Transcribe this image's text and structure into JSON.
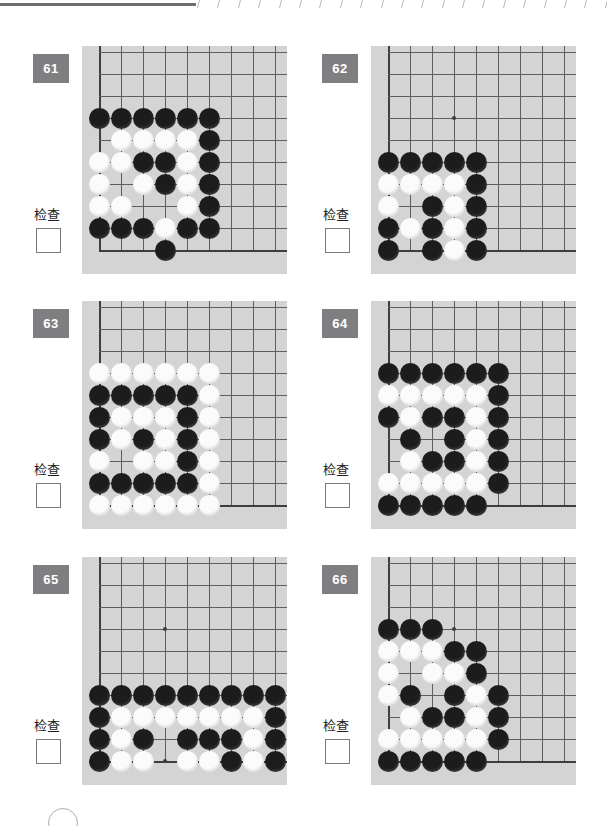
{
  "page": {
    "background_color": "#ffffff",
    "board_color": "#d4d4d4",
    "badge_color": "#7f7f82",
    "line_color": "#5d5d60",
    "black_stone_color": "#1c1c1c",
    "white_stone_color": "#fbfbfb"
  },
  "top_rule": {
    "tick_count": 21
  },
  "common": {
    "check_label": "检查",
    "checkbox_value": ""
  },
  "board_spec": {
    "cols": 9,
    "rows": 9,
    "spacing": 22,
    "origin_x": 17,
    "origin_y": 6,
    "star_points": [
      [
        3,
        3
      ],
      [
        3,
        9
      ]
    ]
  },
  "puzzles": [
    {
      "number": "61",
      "check_label": "检查",
      "black": [
        [
          0,
          3
        ],
        [
          1,
          3
        ],
        [
          2,
          3
        ],
        [
          3,
          3
        ],
        [
          4,
          3
        ],
        [
          5,
          3
        ],
        [
          5,
          4
        ],
        [
          2,
          5
        ],
        [
          3,
          5
        ],
        [
          5,
          5
        ],
        [
          3,
          6
        ],
        [
          5,
          6
        ],
        [
          5,
          7
        ],
        [
          0,
          8
        ],
        [
          1,
          8
        ],
        [
          2,
          8
        ],
        [
          4,
          8
        ],
        [
          5,
          8
        ],
        [
          3,
          9
        ]
      ],
      "white": [
        [
          1,
          4
        ],
        [
          2,
          4
        ],
        [
          3,
          4
        ],
        [
          4,
          4
        ],
        [
          0,
          5
        ],
        [
          1,
          5
        ],
        [
          4,
          5
        ],
        [
          0,
          6
        ],
        [
          2,
          6
        ],
        [
          4,
          6
        ],
        [
          0,
          7
        ],
        [
          1,
          7
        ],
        [
          4,
          7
        ],
        [
          3,
          8
        ]
      ]
    },
    {
      "number": "62",
      "check_label": "检查",
      "black": [
        [
          0,
          5
        ],
        [
          1,
          5
        ],
        [
          2,
          5
        ],
        [
          3,
          5
        ],
        [
          4,
          5
        ],
        [
          4,
          6
        ],
        [
          2,
          7
        ],
        [
          4,
          7
        ],
        [
          0,
          8
        ],
        [
          2,
          8
        ],
        [
          4,
          8
        ],
        [
          0,
          9
        ],
        [
          2,
          9
        ],
        [
          4,
          9
        ]
      ],
      "white": [
        [
          0,
          6
        ],
        [
          1,
          6
        ],
        [
          2,
          6
        ],
        [
          3,
          6
        ],
        [
          0,
          7
        ],
        [
          3,
          7
        ],
        [
          1,
          8
        ],
        [
          3,
          8
        ],
        [
          3,
          9
        ]
      ]
    },
    {
      "number": "63",
      "check_label": "检查",
      "black": [
        [
          0,
          4
        ],
        [
          1,
          4
        ],
        [
          2,
          4
        ],
        [
          3,
          4
        ],
        [
          4,
          4
        ],
        [
          0,
          5
        ],
        [
          4,
          5
        ],
        [
          0,
          6
        ],
        [
          2,
          6
        ],
        [
          4,
          6
        ],
        [
          4,
          7
        ],
        [
          0,
          8
        ],
        [
          1,
          8
        ],
        [
          2,
          8
        ],
        [
          3,
          8
        ],
        [
          4,
          8
        ]
      ],
      "white": [
        [
          0,
          3
        ],
        [
          1,
          3
        ],
        [
          2,
          3
        ],
        [
          3,
          3
        ],
        [
          4,
          3
        ],
        [
          5,
          3
        ],
        [
          5,
          4
        ],
        [
          1,
          5
        ],
        [
          2,
          5
        ],
        [
          3,
          5
        ],
        [
          5,
          5
        ],
        [
          1,
          6
        ],
        [
          3,
          6
        ],
        [
          5,
          6
        ],
        [
          0,
          7
        ],
        [
          2,
          7
        ],
        [
          3,
          7
        ],
        [
          5,
          7
        ],
        [
          5,
          8
        ],
        [
          0,
          9
        ],
        [
          1,
          9
        ],
        [
          2,
          9
        ],
        [
          3,
          9
        ],
        [
          4,
          9
        ],
        [
          5,
          9
        ]
      ]
    },
    {
      "number": "64",
      "check_label": "检查",
      "black": [
        [
          0,
          3
        ],
        [
          1,
          3
        ],
        [
          2,
          3
        ],
        [
          3,
          3
        ],
        [
          4,
          3
        ],
        [
          5,
          3
        ],
        [
          5,
          4
        ],
        [
          0,
          5
        ],
        [
          2,
          5
        ],
        [
          3,
          5
        ],
        [
          5,
          5
        ],
        [
          1,
          6
        ],
        [
          3,
          6
        ],
        [
          5,
          6
        ],
        [
          2,
          7
        ],
        [
          3,
          7
        ],
        [
          5,
          7
        ],
        [
          5,
          8
        ],
        [
          0,
          9
        ],
        [
          1,
          9
        ],
        [
          2,
          9
        ],
        [
          3,
          9
        ],
        [
          4,
          9
        ]
      ],
      "white": [
        [
          0,
          4
        ],
        [
          1,
          4
        ],
        [
          2,
          4
        ],
        [
          3,
          4
        ],
        [
          4,
          4
        ],
        [
          1,
          5
        ],
        [
          4,
          5
        ],
        [
          4,
          6
        ],
        [
          1,
          7
        ],
        [
          4,
          7
        ],
        [
          0,
          8
        ],
        [
          1,
          8
        ],
        [
          2,
          8
        ],
        [
          3,
          8
        ],
        [
          4,
          8
        ]
      ]
    },
    {
      "number": "65",
      "check_label": "检查",
      "black": [
        [
          0,
          6
        ],
        [
          1,
          6
        ],
        [
          2,
          6
        ],
        [
          3,
          6
        ],
        [
          4,
          6
        ],
        [
          5,
          6
        ],
        [
          6,
          6
        ],
        [
          7,
          6
        ],
        [
          8,
          6
        ],
        [
          0,
          7
        ],
        [
          8,
          7
        ],
        [
          0,
          8
        ],
        [
          2,
          8
        ],
        [
          4,
          8
        ],
        [
          5,
          8
        ],
        [
          6,
          8
        ],
        [
          8,
          8
        ],
        [
          0,
          9
        ],
        [
          6,
          9
        ],
        [
          8,
          9
        ]
      ],
      "white": [
        [
          1,
          7
        ],
        [
          2,
          7
        ],
        [
          3,
          7
        ],
        [
          4,
          7
        ],
        [
          5,
          7
        ],
        [
          6,
          7
        ],
        [
          7,
          7
        ],
        [
          1,
          8
        ],
        [
          7,
          8
        ],
        [
          1,
          9
        ],
        [
          2,
          9
        ],
        [
          4,
          9
        ],
        [
          5,
          9
        ],
        [
          7,
          9
        ]
      ]
    },
    {
      "number": "66",
      "check_label": "检查",
      "black": [
        [
          0,
          3
        ],
        [
          1,
          3
        ],
        [
          2,
          3
        ],
        [
          3,
          4
        ],
        [
          4,
          4
        ],
        [
          4,
          5
        ],
        [
          1,
          6
        ],
        [
          3,
          6
        ],
        [
          5,
          6
        ],
        [
          2,
          7
        ],
        [
          3,
          7
        ],
        [
          5,
          7
        ],
        [
          5,
          8
        ],
        [
          0,
          9
        ],
        [
          1,
          9
        ],
        [
          2,
          9
        ],
        [
          3,
          9
        ],
        [
          4,
          9
        ]
      ],
      "white": [
        [
          0,
          4
        ],
        [
          1,
          4
        ],
        [
          2,
          4
        ],
        [
          0,
          5
        ],
        [
          2,
          5
        ],
        [
          3,
          5
        ],
        [
          0,
          6
        ],
        [
          4,
          6
        ],
        [
          1,
          7
        ],
        [
          4,
          7
        ],
        [
          0,
          8
        ],
        [
          1,
          8
        ],
        [
          2,
          8
        ],
        [
          3,
          8
        ],
        [
          4,
          8
        ]
      ]
    }
  ]
}
